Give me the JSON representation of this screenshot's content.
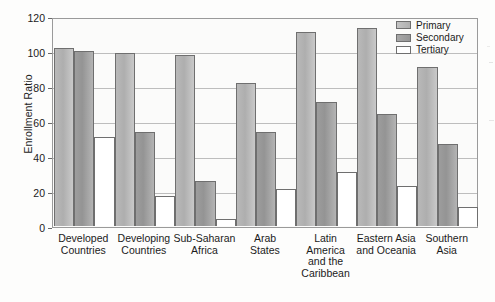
{
  "chart_data": {
    "type": "bar",
    "title": "",
    "xlabel": "",
    "ylabel": "Enrollment Ratio",
    "ylim": [
      0,
      120
    ],
    "yticks": [
      0,
      20,
      40,
      60,
      80,
      100,
      120
    ],
    "grid": true,
    "legend_position": "top-right",
    "categories": [
      "Developed Countries",
      "Developing Countries",
      "Sub-Saharan Africa",
      "Arab States",
      "Latin America and the Caribbean",
      "Eastern Asia and Oceania",
      "Southern Asia"
    ],
    "series": [
      {
        "name": "Primary",
        "color": "#b4b4b4",
        "values": [
          102,
          99,
          98,
          82,
          111,
          113,
          91
        ]
      },
      {
        "name": "Secondary",
        "color": "#9a9a9a",
        "values": [
          100,
          54,
          26,
          54,
          71,
          64,
          47
        ]
      },
      {
        "name": "Tertiary",
        "color": "#ffffff",
        "values": [
          51,
          17,
          4,
          21,
          31,
          23,
          11
        ]
      }
    ]
  },
  "axis": {
    "y_title": "Enrollment Ratio",
    "y_tick_labels": [
      "120",
      "100",
      "80",
      "60",
      "40",
      "20",
      "0"
    ],
    "x_tick_labels": [
      [
        "Developed",
        "Countries"
      ],
      [
        "Developing",
        "Countries"
      ],
      [
        "Sub-Saharan",
        "Africa"
      ],
      [
        "Arab",
        "States"
      ],
      [
        "Latin",
        "America",
        "and the",
        "Caribbean"
      ],
      [
        "Eastern Asia",
        "and Oceania"
      ],
      [
        "Southern",
        "Asia"
      ]
    ]
  },
  "legend": {
    "items": [
      {
        "label": "Primary",
        "swatch": "primary"
      },
      {
        "label": "Secondary",
        "swatch": "secondary"
      },
      {
        "label": "Tertiary",
        "swatch": "tertiary"
      }
    ]
  }
}
